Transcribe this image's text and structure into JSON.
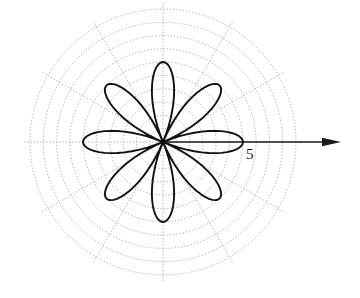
{
  "figure": {
    "kind": "polar-rose-plot",
    "background_color": "#ffffff",
    "curve_color": "#111111",
    "grid_color": "#9a9a9a",
    "axis_color": "#1a1a1a",
    "center": {
      "x": 163,
      "y": 142
    },
    "axis_arrow": {
      "name": "polar-axis-arrow",
      "from_x": 163,
      "from_y": 142,
      "to_x": 341,
      "to_y": 142
    },
    "axis_tick_label": {
      "text": "5",
      "x": 246,
      "y": 147
    },
    "grid": {
      "circle_count": 10,
      "outer_radius": 133,
      "ring_step": 13.3,
      "spoke_count": 12,
      "spoke_step_degrees": 30,
      "spoke_radius": 140,
      "style": "dotted"
    }
  },
  "chart_data": {
    "type": "line",
    "plot_kind": "polar",
    "title": "",
    "xlabel": "",
    "ylabel": "",
    "equation": "r = 5 cos(4θ)",
    "petal_count": 8,
    "petal_max_radius_value": 5,
    "petal_max_radius_px": 80,
    "petal_half_width_degrees": 22.5,
    "petal_angles_degrees": [
      0,
      45,
      90,
      135,
      180,
      225,
      270,
      315
    ],
    "axis_ticks": [
      {
        "value": 5,
        "label": "5",
        "radius_px": 80
      }
    ],
    "radial_axis_range": [
      0,
      8.3
    ],
    "grid": true,
    "legend": "none",
    "annotations": [
      {
        "text": "5",
        "x": 246,
        "y": 147
      }
    ]
  }
}
